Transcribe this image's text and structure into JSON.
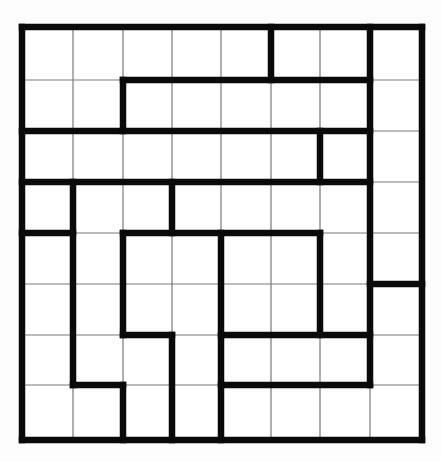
{
  "puzzle": {
    "type": "region-division grid",
    "rows": 8,
    "cols": 8,
    "col_lines_x": [
      22,
      73,
      123,
      172,
      221,
      271,
      320,
      370,
      422
    ],
    "row_lines_y": [
      27,
      80,
      131,
      182,
      233,
      284,
      335,
      385,
      440
    ],
    "colors": {
      "background": "#fdfdfd",
      "thin_line": "#7a7a7a",
      "thick_line": "#0a0a0a"
    },
    "thick_horizontal": [
      {
        "row": 0,
        "from_col": 0,
        "to_col": 8
      },
      {
        "row": 8,
        "from_col": 0,
        "to_col": 8
      },
      {
        "row": 1,
        "from_col": 2,
        "to_col": 7
      },
      {
        "row": 2,
        "from_col": 0,
        "to_col": 7
      },
      {
        "row": 3,
        "from_col": 0,
        "to_col": 7
      },
      {
        "row": 4,
        "from_col": 0,
        "to_col": 1
      },
      {
        "row": 4,
        "from_col": 2,
        "to_col": 6
      },
      {
        "row": 5,
        "from_col": 7,
        "to_col": 8
      },
      {
        "row": 6,
        "from_col": 2,
        "to_col": 3
      },
      {
        "row": 6,
        "from_col": 4,
        "to_col": 7
      },
      {
        "row": 7,
        "from_col": 1,
        "to_col": 2
      },
      {
        "row": 7,
        "from_col": 4,
        "to_col": 7
      }
    ],
    "thick_vertical": [
      {
        "col": 0,
        "from_row": 0,
        "to_row": 8
      },
      {
        "col": 8,
        "from_row": 0,
        "to_row": 8
      },
      {
        "col": 5,
        "from_row": 0,
        "to_row": 1
      },
      {
        "col": 2,
        "from_row": 1,
        "to_row": 2
      },
      {
        "col": 6,
        "from_row": 2,
        "to_row": 3
      },
      {
        "col": 1,
        "from_row": 3,
        "to_row": 7
      },
      {
        "col": 3,
        "from_row": 3,
        "to_row": 4
      },
      {
        "col": 2,
        "from_row": 4,
        "to_row": 6
      },
      {
        "col": 2,
        "from_row": 7,
        "to_row": 8
      },
      {
        "col": 3,
        "from_row": 6,
        "to_row": 8
      },
      {
        "col": 4,
        "from_row": 4,
        "to_row": 8
      },
      {
        "col": 6,
        "from_row": 4,
        "to_row": 6
      },
      {
        "col": 7,
        "from_row": 0,
        "to_row": 7
      }
    ]
  }
}
